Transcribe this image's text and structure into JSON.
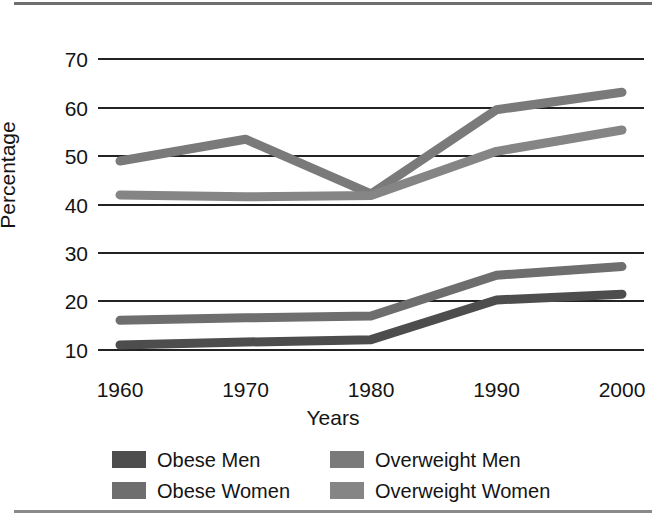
{
  "figure": {
    "top_rule": "horizontal-rule",
    "bottom_rule": "horizontal-rule"
  },
  "chart_data": {
    "type": "line",
    "title": "",
    "xlabel": "Years",
    "ylabel": "Percentage",
    "categories": [
      "1960",
      "1970",
      "1980",
      "1990",
      "2000"
    ],
    "x": [
      1960,
      1970,
      1980,
      1990,
      2000
    ],
    "ylim": [
      5,
      74
    ],
    "yticks": [
      "10",
      "20",
      "30",
      "40",
      "50",
      "60",
      "70"
    ],
    "ytick_values": [
      10,
      20,
      30,
      40,
      50,
      60,
      70
    ],
    "grid": "horizontal",
    "legend_position": "below-axes",
    "series": [
      {
        "name": "Obese Men",
        "color": "#4d4d4d",
        "values": [
          11.0,
          11.6,
          12.1,
          20.3,
          21.5
        ]
      },
      {
        "name": "Obese Women",
        "color": "#6e6e6e",
        "values": [
          16.1,
          16.6,
          17.0,
          25.4,
          27.2
        ]
      },
      {
        "name": "Overweight Men",
        "color": "#7a7a7a",
        "values": [
          49.0,
          53.5,
          42.2,
          59.6,
          63.2
        ]
      },
      {
        "name": "Overweight Women",
        "color": "#858585",
        "values": [
          42.0,
          41.6,
          41.9,
          51.0,
          55.4
        ]
      }
    ]
  },
  "legend": {
    "items": [
      {
        "label": "Obese Men",
        "color": "#4d4d4d"
      },
      {
        "label": "Overweight Men",
        "color": "#7a7a7a"
      },
      {
        "label": "Obese Women",
        "color": "#6e6e6e"
      },
      {
        "label": "Overweight Women",
        "color": "#858585"
      }
    ]
  }
}
